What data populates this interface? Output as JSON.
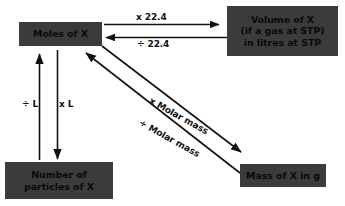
{
  "diagram": {
    "background_color": "#ffffff",
    "node_fill_color": "#3b3b3b",
    "node_text_color": "#0a0a0a",
    "edge_color": "#111111",
    "nodes": [
      {
        "id": "moles",
        "lines": [
          "Moles of X"
        ]
      },
      {
        "id": "volume",
        "lines": [
          "Volume of X",
          "(if a gas at STP)",
          "in litres at STP"
        ]
      },
      {
        "id": "particles",
        "lines": [
          "Number of",
          "particles of X"
        ]
      },
      {
        "id": "mass",
        "lines": [
          "Mass of X in g"
        ]
      }
    ],
    "edges": [
      {
        "id": "moles-to-volume",
        "label": "x 22.4",
        "from": "moles",
        "to": "volume"
      },
      {
        "id": "volume-to-moles",
        "label": "÷ 22.4",
        "from": "volume",
        "to": "moles"
      },
      {
        "id": "particles-to-moles",
        "label": "÷ L",
        "from": "particles",
        "to": "moles"
      },
      {
        "id": "moles-to-particles",
        "label": "x L",
        "from": "moles",
        "to": "particles"
      },
      {
        "id": "moles-to-mass",
        "label": "x Molar mass",
        "from": "moles",
        "to": "mass"
      },
      {
        "id": "mass-to-moles",
        "label": "÷ Molar mass",
        "from": "mass",
        "to": "moles"
      }
    ]
  }
}
